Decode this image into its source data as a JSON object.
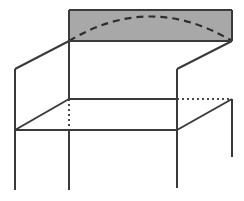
{
  "figure": {
    "title": "",
    "canvas": {
      "width": 244,
      "height": 201,
      "background": "#ffffff"
    },
    "style": {
      "stroke_color": "#3a3a3a",
      "stroke_width": 2,
      "shaded_fill": "#a8a8a8",
      "dashed_color": "#2e2e2e",
      "dotted_color": "#4a4a4a",
      "dash_pattern": "7,5",
      "dot_pattern": "2,3"
    },
    "vertices": {
      "top_back_left": {
        "x": 69,
        "y": 41
      },
      "top_back_right": {
        "x": 232,
        "y": 41
      },
      "panel_top_left": {
        "x": 69,
        "y": 10
      },
      "panel_top_right": {
        "x": 232,
        "y": 10
      },
      "top_front_left": {
        "x": 15,
        "y": 69
      },
      "top_front_right": {
        "x": 177,
        "y": 69
      },
      "mid_back_left": {
        "x": 69,
        "y": 99
      },
      "mid_back_right": {
        "x": 232,
        "y": 99
      },
      "mid_front_left": {
        "x": 15,
        "y": 130
      },
      "mid_front_right": {
        "x": 177,
        "y": 130
      },
      "leg_front_left_bottom": {
        "x": 15,
        "y": 190
      },
      "leg_back_left_bottom": {
        "x": 69,
        "y": 190
      },
      "leg_front_right_bottom": {
        "x": 177,
        "y": 188
      },
      "leg_back_right_bottom": {
        "x": 232,
        "y": 157
      }
    },
    "arc": {
      "start": {
        "x": 69,
        "y": 41
      },
      "control": {
        "x": 150,
        "y": -8
      },
      "end": {
        "x": 232,
        "y": 41
      },
      "peak": {
        "x": 150,
        "y": 17
      },
      "style": "dashed"
    },
    "shaded_panel": {
      "x": 69,
      "y": 10,
      "width": 163,
      "height": 31,
      "fill": "#a8a8a8",
      "label": "shaded-top-panel"
    },
    "hidden_edges": [
      {
        "name": "vertical-hidden-edge",
        "x1": 69,
        "y1": 99,
        "x2": 69,
        "y2": 130,
        "style": "dotted"
      },
      {
        "name": "horizontal-hidden-edge",
        "x1": 177,
        "y1": 99,
        "x2": 232,
        "y2": 99,
        "style": "dotted"
      }
    ],
    "solid_edges": [
      {
        "name": "panel-left-edge",
        "x1": 69,
        "y1": 10,
        "x2": 69,
        "y2": 41
      },
      {
        "name": "panel-top-edge",
        "x1": 69,
        "y1": 10,
        "x2": 232,
        "y2": 10
      },
      {
        "name": "panel-right-edge",
        "x1": 232,
        "y1": 10,
        "x2": 232,
        "y2": 41
      },
      {
        "name": "panel-bottom-edge",
        "x1": 69,
        "y1": 41,
        "x2": 232,
        "y2": 41
      },
      {
        "name": "top-left-diagonal",
        "x1": 69,
        "y1": 41,
        "x2": 15,
        "y2": 69
      },
      {
        "name": "top-right-diagonal",
        "x1": 232,
        "y1": 41,
        "x2": 177,
        "y2": 69
      },
      {
        "name": "left-panel-front-post",
        "x1": 15,
        "y1": 69,
        "x2": 15,
        "y2": 130
      },
      {
        "name": "right-panel-front-post",
        "x1": 177,
        "y1": 69,
        "x2": 177,
        "y2": 130
      },
      {
        "name": "left-back-post-upper",
        "x1": 69,
        "y1": 41,
        "x2": 69,
        "y2": 99
      },
      {
        "name": "mid-back-rail",
        "x1": 69,
        "y1": 99,
        "x2": 177,
        "y2": 99
      },
      {
        "name": "lower-left-diagonal",
        "x1": 69,
        "y1": 99,
        "x2": 15,
        "y2": 130
      },
      {
        "name": "lower-right-diagonal",
        "x1": 232,
        "y1": 99,
        "x2": 177,
        "y2": 130
      },
      {
        "name": "mid-front-rail",
        "x1": 15,
        "y1": 130,
        "x2": 177,
        "y2": 130
      },
      {
        "name": "leg-front-left",
        "x1": 15,
        "y1": 130,
        "x2": 15,
        "y2": 190
      },
      {
        "name": "leg-back-left",
        "x1": 69,
        "y1": 130,
        "x2": 69,
        "y2": 190
      },
      {
        "name": "leg-front-right",
        "x1": 177,
        "y1": 130,
        "x2": 177,
        "y2": 188
      },
      {
        "name": "leg-back-right",
        "x1": 232,
        "y1": 99,
        "x2": 232,
        "y2": 157
      }
    ]
  }
}
